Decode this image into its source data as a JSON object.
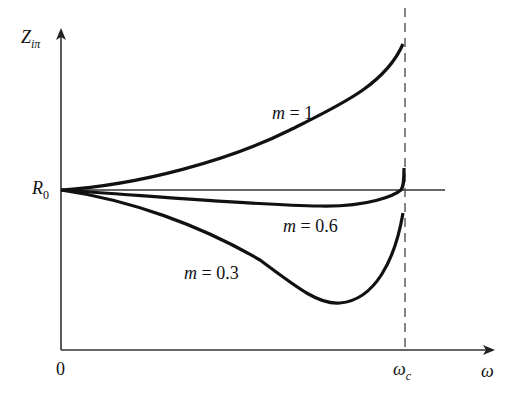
{
  "chart_data": {
    "type": "line",
    "title": "",
    "xlabel": "ω",
    "ylabel": "Z_iπ",
    "x_ticks": [
      {
        "label": "0",
        "value": 0
      },
      {
        "label": "ω_c",
        "value": 1
      }
    ],
    "y_ticks": [
      {
        "label": "R_0",
        "value": 1
      }
    ],
    "reference_lines": [
      {
        "type": "horizontal",
        "at": "R_0",
        "style": "solid"
      },
      {
        "type": "vertical",
        "at": "ω_c",
        "style": "dashed"
      }
    ],
    "x_range": [
      0,
      1.0
    ],
    "grid": false,
    "legend": "inline labels",
    "series": [
      {
        "name": "m = 1",
        "x": [
          0,
          0.1,
          0.2,
          0.3,
          0.4,
          0.5,
          0.6,
          0.7,
          0.8,
          0.9,
          0.95,
          0.99
        ],
        "y_relative": [
          0,
          0.01,
          0.04,
          0.09,
          0.16,
          0.25,
          0.36,
          0.5,
          0.68,
          0.93,
          1.12,
          1.35
        ]
      },
      {
        "name": "m = 0.6",
        "x": [
          0,
          0.1,
          0.2,
          0.3,
          0.4,
          0.5,
          0.6,
          0.7,
          0.8,
          0.9,
          0.95,
          0.99
        ],
        "y_relative": [
          0,
          -0.01,
          -0.03,
          -0.05,
          -0.07,
          -0.09,
          -0.1,
          -0.11,
          -0.1,
          -0.06,
          0.02,
          0.22
        ]
      },
      {
        "name": "m = 0.3",
        "x": [
          0,
          0.1,
          0.2,
          0.3,
          0.4,
          0.5,
          0.6,
          0.7,
          0.8,
          0.9,
          0.95,
          0.99
        ],
        "y_relative": [
          0,
          -0.02,
          -0.07,
          -0.15,
          -0.26,
          -0.4,
          -0.58,
          -0.76,
          -0.83,
          -0.7,
          -0.52,
          -0.22
        ]
      }
    ]
  },
  "labels": {
    "y_axis": "Z",
    "y_axis_sub": "iπ",
    "x_axis": "ω",
    "origin": "0",
    "omega_c": "ω",
    "omega_c_sub": "c",
    "r0": "R",
    "r0_sub": "0",
    "m1": "m = 1",
    "m06": "m = 0.6",
    "m03": "m = 0.3"
  }
}
